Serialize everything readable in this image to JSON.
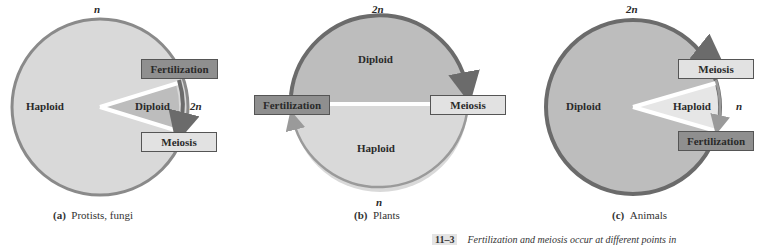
{
  "panels": [
    {
      "id": "a",
      "caption_letter": "(a)",
      "caption_text": "Protists, fungi",
      "large_region": "Haploid",
      "small_region": "Diploid",
      "top_ploidy": "n",
      "side_ploidy": "2n",
      "box_top": "Fertilization",
      "box_bottom": "Meiosis"
    },
    {
      "id": "b",
      "caption_letter": "(b)",
      "caption_text": "Plants",
      "upper_region": "Diploid",
      "lower_region": "Haploid",
      "top_ploidy": "2n",
      "bottom_ploidy": "n",
      "box_left": "Fertilization",
      "box_right": "Meiosis"
    },
    {
      "id": "c",
      "caption_letter": "(c)",
      "caption_text": "Animals",
      "large_region": "Diploid",
      "small_region": "Haploid",
      "top_ploidy": "2n",
      "side_ploidy": "n",
      "box_top": "Meiosis",
      "box_bottom": "Fertilization"
    }
  ],
  "figure_caption": {
    "number": "11–3",
    "text": "Fertilization and meiosis occur at different points in"
  },
  "colors": {
    "haploid_fill": "#d9d9d9",
    "diploid_fill": "#bdbdbd",
    "dark_arc": "#6b6b6b",
    "light_arc": "#9a9a9a",
    "dark_box": "#8f8f8f",
    "light_box": "#e2e2e2"
  }
}
